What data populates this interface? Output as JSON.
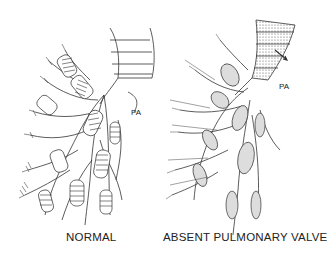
{
  "figure": {
    "panels": [
      {
        "id": "normal",
        "caption": "NORMAL",
        "label": "PA"
      },
      {
        "id": "absent",
        "caption": "ABSENT PULMONARY VALVE",
        "label": "PA"
      }
    ]
  }
}
